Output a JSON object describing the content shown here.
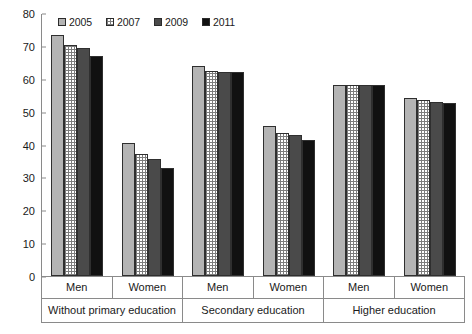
{
  "chart_data": {
    "type": "bar",
    "title": "",
    "xlabel": "",
    "ylabel": "",
    "ylim": [
      0,
      80
    ],
    "yticks": [
      0,
      10,
      20,
      30,
      40,
      50,
      60,
      70,
      80
    ],
    "grid": false,
    "legend_position": "top",
    "categories": [
      "Without primary education - Men",
      "Without primary education - Women",
      "Secondary education - Men",
      "Secondary education - Women",
      "Higher education - Men",
      "Higher education - Women"
    ],
    "group_labels": [
      "Without primary education",
      "Secondary education",
      "Higher education"
    ],
    "subgroup_labels": [
      "Men",
      "Women",
      "Men",
      "Women",
      "Men",
      "Women"
    ],
    "series": [
      {
        "name": "2005",
        "color": "#b4b4b4",
        "values": [
          73.3,
          40.5,
          64.0,
          45.5,
          58.0,
          54.0
        ]
      },
      {
        "name": "2007",
        "color": "#ffffff",
        "values": [
          70.2,
          37.0,
          62.5,
          43.5,
          58.0,
          53.5
        ]
      },
      {
        "name": "2009",
        "color": "#4a4a4a",
        "values": [
          69.3,
          35.5,
          62.0,
          43.0,
          58.0,
          53.0
        ]
      },
      {
        "name": "2011",
        "color": "#111111",
        "values": [
          66.8,
          33.0,
          62.0,
          41.5,
          58.0,
          52.5
        ]
      }
    ]
  },
  "legend": {
    "entries": [
      {
        "label": "2005"
      },
      {
        "label": "2007"
      },
      {
        "label": "2009"
      },
      {
        "label": "2011"
      }
    ]
  }
}
